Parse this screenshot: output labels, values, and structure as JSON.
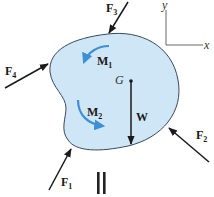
{
  "diagram": {
    "colors": {
      "body_fill": "#cfe6f7",
      "body_stroke": "#3a4a5a",
      "moment_arrow": "#3d8fd6",
      "force_arrow": "#1a1a1a",
      "axis": "#555555"
    },
    "axes": {
      "x_label": "x",
      "y_label": "y"
    },
    "center_of_gravity": {
      "label": "G"
    },
    "weight": {
      "label": "W"
    },
    "forces": [
      {
        "id": "F1",
        "symbol": "F",
        "subscript": "1"
      },
      {
        "id": "F2",
        "symbol": "F",
        "subscript": "2"
      },
      {
        "id": "F3",
        "symbol": "F",
        "subscript": "3"
      },
      {
        "id": "F4",
        "symbol": "F",
        "subscript": "4"
      }
    ],
    "moments": [
      {
        "id": "M1",
        "symbol": "M",
        "subscript": "1",
        "direction": "counterclockwise"
      },
      {
        "id": "M2",
        "symbol": "M",
        "subscript": "2",
        "direction": "counterclockwise"
      }
    ],
    "equals_sign": "="
  }
}
